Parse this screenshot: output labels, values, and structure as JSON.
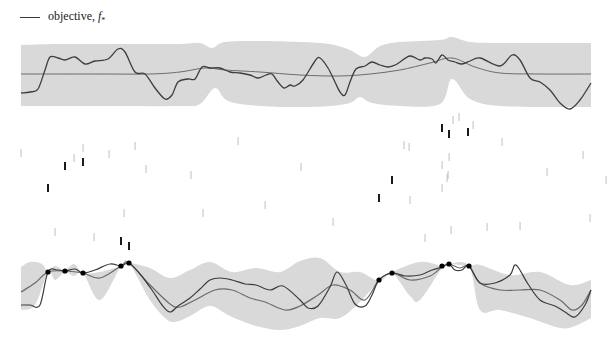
{
  "legend": {
    "label": "objective, ",
    "symbol": "f",
    "subscript": "*"
  },
  "colors": {
    "band": "#d9d9d9",
    "mean": "#6b6b6b",
    "objective": "#3d3d3d",
    "tick_light": "#b8b8b8",
    "tick_dark": "#1a1a1a",
    "point": "#000000"
  },
  "chart_data": [
    {
      "type": "line",
      "title": "prior",
      "legend": [
        "objective, f*"
      ],
      "xlim": [
        21,
        591
      ],
      "band_upper": [
        [
          21,
          45
        ],
        [
          60,
          44
        ],
        [
          120,
          44
        ],
        [
          180,
          44
        ],
        [
          200,
          43
        ],
        [
          212,
          48
        ],
        [
          225,
          42
        ],
        [
          260,
          41
        ],
        [
          300,
          42
        ],
        [
          330,
          44
        ],
        [
          350,
          50
        ],
        [
          365,
          57
        ],
        [
          380,
          46
        ],
        [
          400,
          42
        ],
        [
          440,
          40
        ],
        [
          452,
          37
        ],
        [
          470,
          42
        ],
        [
          500,
          43
        ],
        [
          560,
          43
        ],
        [
          591,
          43
        ]
      ],
      "band_lower": [
        [
          21,
          106
        ],
        [
          100,
          106
        ],
        [
          180,
          106
        ],
        [
          200,
          104
        ],
        [
          215,
          88
        ],
        [
          228,
          101
        ],
        [
          260,
          106
        ],
        [
          300,
          107
        ],
        [
          330,
          106
        ],
        [
          350,
          103
        ],
        [
          360,
          97
        ],
        [
          372,
          103
        ],
        [
          400,
          106
        ],
        [
          440,
          104
        ],
        [
          452,
          79
        ],
        [
          470,
          99
        ],
        [
          500,
          106
        ],
        [
          560,
          107
        ],
        [
          591,
          107
        ]
      ],
      "mean": [
        [
          21,
          74
        ],
        [
          100,
          74
        ],
        [
          150,
          74
        ],
        [
          180,
          72
        ],
        [
          205,
          68
        ],
        [
          225,
          70
        ],
        [
          260,
          72
        ],
        [
          300,
          75
        ],
        [
          340,
          76
        ],
        [
          370,
          74
        ],
        [
          400,
          70
        ],
        [
          430,
          63
        ],
        [
          452,
          58
        ],
        [
          475,
          67
        ],
        [
          500,
          73
        ],
        [
          540,
          74
        ],
        [
          591,
          74
        ]
      ],
      "objective": [
        [
          21,
          93
        ],
        [
          30,
          92
        ],
        [
          38,
          89
        ],
        [
          45,
          70
        ],
        [
          50,
          57
        ],
        [
          58,
          58
        ],
        [
          65,
          60
        ],
        [
          75,
          57
        ],
        [
          85,
          64
        ],
        [
          95,
          61
        ],
        [
          108,
          59
        ],
        [
          118,
          49
        ],
        [
          125,
          52
        ],
        [
          135,
          72
        ],
        [
          145,
          74
        ],
        [
          155,
          88
        ],
        [
          165,
          99
        ],
        [
          172,
          95
        ],
        [
          178,
          82
        ],
        [
          188,
          79
        ],
        [
          195,
          79
        ],
        [
          202,
          67
        ],
        [
          210,
          68
        ],
        [
          220,
          68
        ],
        [
          230,
          72
        ],
        [
          240,
          73
        ],
        [
          250,
          75
        ],
        [
          258,
          78
        ],
        [
          266,
          75
        ],
        [
          272,
          74
        ],
        [
          278,
          82
        ],
        [
          284,
          88
        ],
        [
          290,
          85
        ],
        [
          295,
          86
        ],
        [
          303,
          80
        ],
        [
          315,
          61
        ],
        [
          320,
          58
        ],
        [
          328,
          68
        ],
        [
          335,
          82
        ],
        [
          340,
          92
        ],
        [
          345,
          95
        ],
        [
          350,
          82
        ],
        [
          356,
          69
        ],
        [
          365,
          66
        ],
        [
          372,
          62
        ],
        [
          380,
          65
        ],
        [
          388,
          67
        ],
        [
          395,
          65
        ],
        [
          400,
          62
        ],
        [
          410,
          56
        ],
        [
          420,
          60
        ],
        [
          425,
          58
        ],
        [
          432,
          59
        ],
        [
          436,
          63
        ],
        [
          442,
          55
        ],
        [
          448,
          60
        ],
        [
          455,
          62
        ],
        [
          462,
          64
        ],
        [
          470,
          61
        ],
        [
          480,
          58
        ],
        [
          500,
          66
        ],
        [
          512,
          55
        ],
        [
          520,
          60
        ],
        [
          530,
          78
        ],
        [
          540,
          82
        ],
        [
          550,
          90
        ],
        [
          560,
          103
        ],
        [
          570,
          109
        ],
        [
          580,
          100
        ],
        [
          591,
          83
        ]
      ]
    },
    {
      "type": "scatter",
      "title": "evaluation ticks",
      "ticks_light": [
        [
          21,
          153
        ],
        [
          74,
          158
        ],
        [
          83,
          148
        ],
        [
          109,
          154
        ],
        [
          135,
          146
        ],
        [
          124,
          213
        ],
        [
          146,
          169
        ],
        [
          55,
          232
        ],
        [
          94,
          237
        ],
        [
          191,
          175
        ],
        [
          238,
          141
        ],
        [
          265,
          205
        ],
        [
          203,
          213
        ],
        [
          301,
          167
        ],
        [
          333,
          222
        ],
        [
          404,
          145
        ],
        [
          410,
          200
        ],
        [
          409,
          147
        ],
        [
          442,
          188
        ],
        [
          448,
          175
        ],
        [
          449,
          157
        ],
        [
          453,
          120
        ],
        [
          459,
          117
        ],
        [
          473,
          125
        ],
        [
          425,
          238
        ],
        [
          451,
          230
        ],
        [
          447,
          178
        ],
        [
          442,
          165
        ],
        [
          502,
          142
        ],
        [
          547,
          172
        ],
        [
          583,
          155
        ],
        [
          590,
          218
        ],
        [
          487,
          227
        ],
        [
          520,
          226
        ],
        [
          606,
          180
        ]
      ],
      "ticks_dark": [
        [
          48,
          188
        ],
        [
          65,
          166
        ],
        [
          83,
          162
        ],
        [
          121,
          241
        ],
        [
          129,
          246
        ],
        [
          379,
          198
        ],
        [
          392,
          180
        ],
        [
          442,
          128
        ],
        [
          449,
          134
        ],
        [
          468,
          132
        ]
      ]
    },
    {
      "type": "line",
      "title": "posterior",
      "xlim": [
        21,
        591
      ],
      "band_upper": [
        [
          21,
          267
        ],
        [
          30,
          262
        ],
        [
          42,
          264
        ],
        [
          48,
          272
        ],
        [
          55,
          266
        ],
        [
          65,
          270
        ],
        [
          74,
          264
        ],
        [
          83,
          273
        ],
        [
          100,
          272
        ],
        [
          121,
          266
        ],
        [
          129,
          263
        ],
        [
          150,
          268
        ],
        [
          170,
          278
        ],
        [
          190,
          270
        ],
        [
          210,
          262
        ],
        [
          232,
          272
        ],
        [
          256,
          268
        ],
        [
          280,
          272
        ],
        [
          300,
          261
        ],
        [
          320,
          258
        ],
        [
          340,
          272
        ],
        [
          360,
          272
        ],
        [
          379,
          281
        ],
        [
          392,
          272
        ],
        [
          420,
          262
        ],
        [
          442,
          266
        ],
        [
          449,
          264
        ],
        [
          469,
          266
        ],
        [
          480,
          265
        ],
        [
          510,
          275
        ],
        [
          540,
          272
        ],
        [
          570,
          285
        ],
        [
          591,
          280
        ]
      ],
      "band_lower": [
        [
          21,
          310
        ],
        [
          35,
          305
        ],
        [
          48,
          272
        ],
        [
          55,
          280
        ],
        [
          65,
          272
        ],
        [
          74,
          276
        ],
        [
          83,
          273
        ],
        [
          100,
          300
        ],
        [
          121,
          266
        ],
        [
          129,
          263
        ],
        [
          150,
          300
        ],
        [
          165,
          318
        ],
        [
          175,
          322
        ],
        [
          190,
          316
        ],
        [
          210,
          306
        ],
        [
          230,
          316
        ],
        [
          256,
          326
        ],
        [
          280,
          330
        ],
        [
          300,
          326
        ],
        [
          320,
          318
        ],
        [
          340,
          318
        ],
        [
          360,
          302
        ],
        [
          379,
          281
        ],
        [
          392,
          273
        ],
        [
          410,
          296
        ],
        [
          420,
          300
        ],
        [
          442,
          268
        ],
        [
          449,
          264
        ],
        [
          469,
          266
        ],
        [
          480,
          310
        ],
        [
          500,
          310
        ],
        [
          530,
          318
        ],
        [
          560,
          328
        ],
        [
          575,
          326
        ],
        [
          591,
          318
        ]
      ],
      "mean": [
        [
          21,
          292
        ],
        [
          35,
          283
        ],
        [
          48,
          272
        ],
        [
          65,
          271
        ],
        [
          83,
          273
        ],
        [
          100,
          278
        ],
        [
          121,
          266
        ],
        [
          129,
          263
        ],
        [
          150,
          285
        ],
        [
          170,
          304
        ],
        [
          180,
          307
        ],
        [
          195,
          300
        ],
        [
          215,
          290
        ],
        [
          232,
          290
        ],
        [
          250,
          298
        ],
        [
          265,
          302
        ],
        [
          285,
          310
        ],
        [
          300,
          306
        ],
        [
          318,
          295
        ],
        [
          333,
          285
        ],
        [
          350,
          290
        ],
        [
          365,
          300
        ],
        [
          379,
          280
        ],
        [
          392,
          273
        ],
        [
          410,
          280
        ],
        [
          430,
          276
        ],
        [
          442,
          267
        ],
        [
          449,
          264
        ],
        [
          460,
          268
        ],
        [
          469,
          266
        ],
        [
          480,
          283
        ],
        [
          500,
          290
        ],
        [
          520,
          290
        ],
        [
          540,
          290
        ],
        [
          560,
          300
        ],
        [
          572,
          310
        ],
        [
          582,
          305
        ],
        [
          591,
          290
        ]
      ],
      "objective": [
        [
          21,
          305
        ],
        [
          30,
          305
        ],
        [
          40,
          305
        ],
        [
          48,
          272
        ],
        [
          58,
          270
        ],
        [
          65,
          271
        ],
        [
          75,
          269
        ],
        [
          83,
          273
        ],
        [
          95,
          270
        ],
        [
          110,
          264
        ],
        [
          121,
          266
        ],
        [
          129,
          263
        ],
        [
          140,
          274
        ],
        [
          152,
          290
        ],
        [
          162,
          305
        ],
        [
          170,
          312
        ],
        [
          178,
          306
        ],
        [
          190,
          298
        ],
        [
          200,
          289
        ],
        [
          210,
          280
        ],
        [
          220,
          278
        ],
        [
          232,
          280
        ],
        [
          245,
          284
        ],
        [
          256,
          285
        ],
        [
          270,
          290
        ],
        [
          283,
          286
        ],
        [
          300,
          300
        ],
        [
          308,
          308
        ],
        [
          318,
          306
        ],
        [
          330,
          287
        ],
        [
          337,
          272
        ],
        [
          346,
          285
        ],
        [
          355,
          304
        ],
        [
          365,
          306
        ],
        [
          372,
          295
        ],
        [
          379,
          280
        ],
        [
          392,
          273
        ],
        [
          405,
          276
        ],
        [
          420,
          275
        ],
        [
          432,
          270
        ],
        [
          442,
          267
        ],
        [
          449,
          264
        ],
        [
          455,
          270
        ],
        [
          462,
          270
        ],
        [
          469,
          266
        ],
        [
          480,
          283
        ],
        [
          495,
          283
        ],
        [
          510,
          275
        ],
        [
          516,
          265
        ],
        [
          528,
          284
        ],
        [
          540,
          300
        ],
        [
          555,
          306
        ],
        [
          565,
          312
        ],
        [
          575,
          317
        ],
        [
          585,
          305
        ],
        [
          591,
          290
        ]
      ],
      "observations": [
        [
          48,
          272
        ],
        [
          65,
          271
        ],
        [
          83,
          273
        ],
        [
          121,
          266
        ],
        [
          129,
          263
        ],
        [
          379,
          280
        ],
        [
          392,
          273
        ],
        [
          442,
          266
        ],
        [
          449,
          264
        ],
        [
          469,
          266
        ]
      ]
    }
  ]
}
